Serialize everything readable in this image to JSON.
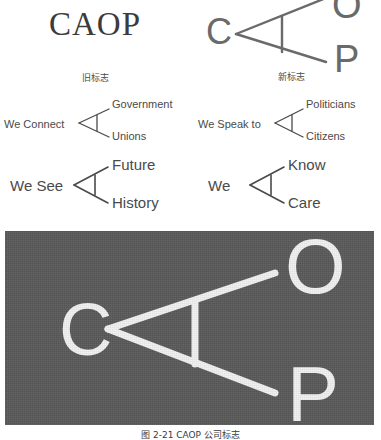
{
  "figure": {
    "caption": "图 2-21  CAOP 公司标志"
  },
  "logo_comparison": {
    "old": {
      "wordmark": "CAOP",
      "caption": "旧标志"
    },
    "new": {
      "caption": "新标志",
      "letters": {
        "c": "C",
        "o": "O",
        "p": "P"
      }
    }
  },
  "taglines": [
    {
      "id": "we-connect",
      "main": "We Connect",
      "branches": [
        "Government",
        "Unions"
      ]
    },
    {
      "id": "we-speak-to",
      "main": "We Speak to",
      "branches": [
        "Politicians",
        "Citizens"
      ]
    },
    {
      "id": "we-see",
      "main": "We See",
      "branches": [
        "Future",
        "History"
      ]
    },
    {
      "id": "we",
      "main": "We",
      "branches": [
        "Know",
        "Care"
      ]
    }
  ],
  "hero": {
    "background_color": "#595959",
    "mark_color": "#f2f2f2",
    "letters": {
      "c": "C",
      "o": "O",
      "p": "P"
    }
  },
  "colors": {
    "text": "#4a4a4a",
    "wordmark": "#3b3b3b",
    "mark_stroke": "#6a6a6a",
    "panel_bg": "#595959",
    "panel_mark": "#f2f2f2"
  }
}
